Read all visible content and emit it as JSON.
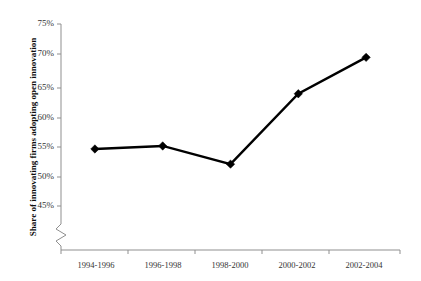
{
  "chart_data": {
    "type": "line",
    "title": "",
    "subtitle": "",
    "xlabel": "",
    "ylabel": "Share of innovating firms adopting open innovation",
    "categories": [
      "1994-1996",
      "1996-1998",
      "1998-2000",
      "2000-2002",
      "2002-2004"
    ],
    "series": [
      {
        "name": "Share of innovating firms adopting open innovation",
        "values": [
          54.4,
          54.9,
          51.9,
          63.5,
          69.5
        ]
      }
    ],
    "ylim": [
      45,
      75
    ],
    "yticks": [
      45,
      50,
      55,
      60,
      65,
      70,
      75
    ],
    "ytick_labels": [
      "45%",
      "50%",
      "55%",
      "60%",
      "65%",
      "70%",
      "75%"
    ],
    "grid": false,
    "legend": false,
    "axis_break": true,
    "marker": "diamond",
    "line_color": "#000000",
    "marker_color": "#000000",
    "axis_color": "#8f8f8f",
    "background": "#ffffff"
  },
  "ytick_labels": {
    "t0": "75%",
    "t1": "70%",
    "t2": "65%",
    "t3": "60%",
    "t4": "55%",
    "t5": "50%",
    "t6": "45%"
  },
  "xtick_labels": {
    "c0": "1994-1996",
    "c1": "1996-1998",
    "c2": "1998-2000",
    "c3": "2000-2002",
    "c4": "2002-2004"
  },
  "axis": {
    "y_title": "Share of innovating firms adopting open innovation"
  }
}
